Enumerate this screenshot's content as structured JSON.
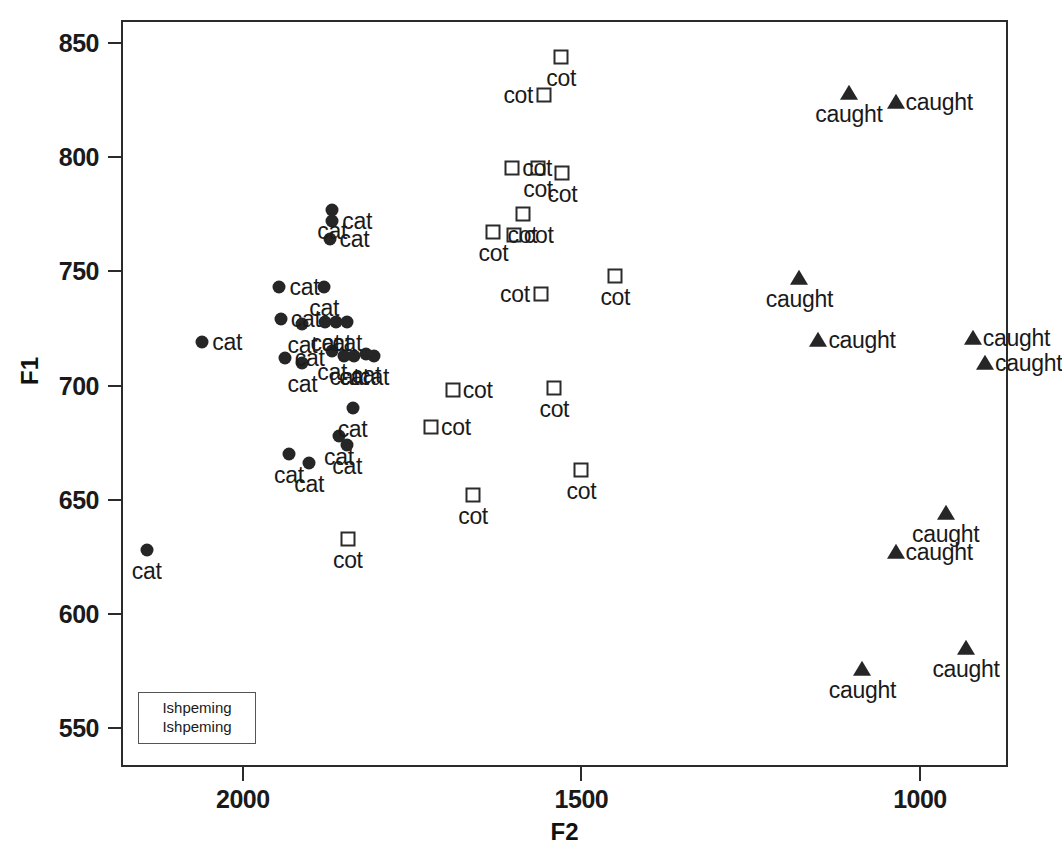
{
  "chart_data": {
    "type": "scatter",
    "title": "",
    "xlabel": "F2",
    "ylabel": "F1",
    "xlim": [
      2180,
      870
    ],
    "ylim": [
      860,
      533
    ],
    "x_reversed": true,
    "y_reversed": true,
    "grid": false,
    "xticks": [
      2000,
      1500,
      1000
    ],
    "xtick_labels": [
      "2000",
      "1500",
      "1000"
    ],
    "yticks": [
      550,
      600,
      650,
      700,
      750,
      800,
      850
    ],
    "ytick_labels": [
      "550",
      "600",
      "650",
      "700",
      "750",
      "800",
      "850"
    ],
    "legend_position": "bottom-left",
    "legend_entries": [
      "Ishpeming",
      "Ishpeming"
    ],
    "series": [
      {
        "name": "cat",
        "marker": "filled-circle",
        "color": "#262626",
        "label": "cat",
        "points": [
          {
            "x": 2142,
            "y": 628,
            "label_pos": "below"
          },
          {
            "x": 1932,
            "y": 670,
            "label_pos": "below"
          },
          {
            "x": 1902,
            "y": 666,
            "label_pos": "below"
          },
          {
            "x": 1858,
            "y": 678,
            "label_pos": "below"
          },
          {
            "x": 1846,
            "y": 674,
            "label_pos": "below"
          },
          {
            "x": 1838,
            "y": 690,
            "label_pos": "below"
          },
          {
            "x": 1912,
            "y": 710,
            "label_pos": "below"
          },
          {
            "x": 1868,
            "y": 715,
            "label_pos": "below"
          },
          {
            "x": 1850,
            "y": 713,
            "label_pos": "below"
          },
          {
            "x": 1836,
            "y": 713,
            "label_pos": "below"
          },
          {
            "x": 1818,
            "y": 714,
            "label_pos": "below"
          },
          {
            "x": 1806,
            "y": 713,
            "label_pos": "below"
          },
          {
            "x": 1938,
            "y": 712,
            "label_pos": "right"
          },
          {
            "x": 2060,
            "y": 719,
            "label_pos": "right"
          },
          {
            "x": 1912,
            "y": 727,
            "label_pos": "below"
          },
          {
            "x": 1878,
            "y": 728,
            "label_pos": "below"
          },
          {
            "x": 1862,
            "y": 728,
            "label_pos": "below"
          },
          {
            "x": 1846,
            "y": 728,
            "label_pos": "below"
          },
          {
            "x": 1944,
            "y": 729,
            "label_pos": "right"
          },
          {
            "x": 1880,
            "y": 743,
            "label_pos": "below"
          },
          {
            "x": 1946,
            "y": 743,
            "label_pos": "right"
          },
          {
            "x": 1872,
            "y": 764,
            "label_pos": "right"
          },
          {
            "x": 1868,
            "y": 772,
            "label_pos": "right"
          },
          {
            "x": 1868,
            "y": 777,
            "label_pos": "below"
          }
        ]
      },
      {
        "name": "cot",
        "marker": "open-square",
        "color": "#2b2b2b",
        "label": "cot",
        "points": [
          {
            "x": 1845,
            "y": 633,
            "label_pos": "below"
          },
          {
            "x": 1660,
            "y": 652,
            "label_pos": "below"
          },
          {
            "x": 1500,
            "y": 663,
            "label_pos": "below"
          },
          {
            "x": 1722,
            "y": 682,
            "label_pos": "right"
          },
          {
            "x": 1540,
            "y": 699,
            "label_pos": "below"
          },
          {
            "x": 1690,
            "y": 698,
            "label_pos": "right"
          },
          {
            "x": 1560,
            "y": 740,
            "label_pos": "left"
          },
          {
            "x": 1450,
            "y": 748,
            "label_pos": "below"
          },
          {
            "x": 1600,
            "y": 766,
            "label_pos": "right"
          },
          {
            "x": 1630,
            "y": 767,
            "label_pos": "below"
          },
          {
            "x": 1587,
            "y": 775,
            "label_pos": "below"
          },
          {
            "x": 1528,
            "y": 793,
            "label_pos": "below"
          },
          {
            "x": 1564,
            "y": 795,
            "label_pos": "below"
          },
          {
            "x": 1602,
            "y": 795,
            "label_pos": "right"
          },
          {
            "x": 1555,
            "y": 827,
            "label_pos": "left"
          },
          {
            "x": 1530,
            "y": 844,
            "label_pos": "below"
          }
        ]
      },
      {
        "name": "caught",
        "marker": "filled-triangle",
        "color": "#262626",
        "label": "caught",
        "points": [
          {
            "x": 1085,
            "y": 576,
            "label_pos": "below"
          },
          {
            "x": 932,
            "y": 585,
            "label_pos": "below"
          },
          {
            "x": 1036,
            "y": 627,
            "label_pos": "right"
          },
          {
            "x": 962,
            "y": 644,
            "label_pos": "below"
          },
          {
            "x": 904,
            "y": 710,
            "label_pos": "right"
          },
          {
            "x": 1150,
            "y": 720,
            "label_pos": "right"
          },
          {
            "x": 922,
            "y": 721,
            "label_pos": "right"
          },
          {
            "x": 1178,
            "y": 747,
            "label_pos": "below"
          },
          {
            "x": 1036,
            "y": 824,
            "label_pos": "right"
          },
          {
            "x": 1105,
            "y": 828,
            "label_pos": "below"
          }
        ]
      }
    ]
  }
}
